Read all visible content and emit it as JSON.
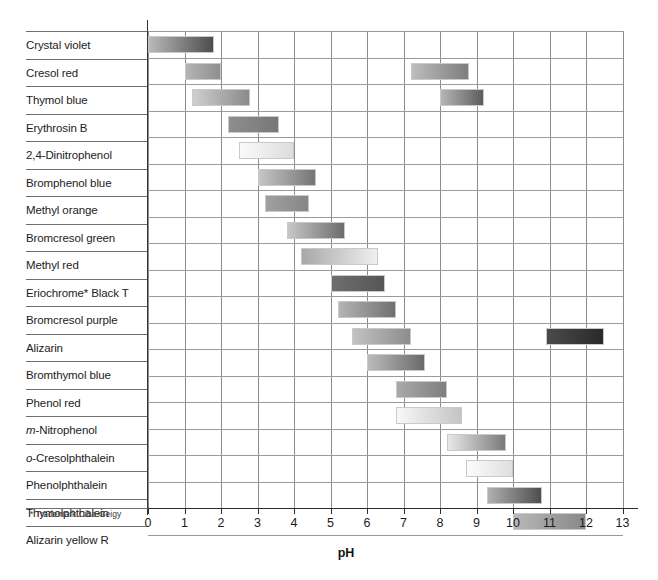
{
  "figure": {
    "axis_title": "pH",
    "footnote": "* Trademark Ciba-Geigy",
    "tick_labels": [
      "0",
      "1",
      "2",
      "3",
      "4",
      "5",
      "6",
      "7",
      "8",
      "9",
      "10",
      "11",
      "12",
      "13"
    ]
  },
  "chart_data": {
    "type": "bar",
    "orientation": "horizontal-range",
    "title": "",
    "xlabel": "pH",
    "ylabel": "",
    "xlim": [
      0,
      13
    ],
    "xticks": [
      0,
      1,
      2,
      3,
      4,
      5,
      6,
      7,
      8,
      9,
      10,
      11,
      12,
      13
    ],
    "grid": "vertical-and-horizontal",
    "legend": "none",
    "note": "Each indicator shows its pH transition interval(s) as a shaded colour-change band (rendered in greyscale).",
    "categories": [
      "Crystal violet",
      "Cresol red",
      "Thymol blue",
      "Erythrosin B",
      "2,4-Dinitrophenol",
      "Bromphenol blue",
      "Methyl orange",
      "Bromcresol green",
      "Methyl red",
      "Eriochrome* Black T",
      "Bromcresol purple",
      "Alizarin",
      "Bromthymol blue",
      "Phenol red",
      "m-Nitrophenol",
      "o-Cresolphthalein",
      "Phenolphthalein",
      "Thymolphthalein",
      "Alizarin yellow R"
    ],
    "indicators": [
      {
        "name": "Crystal violet",
        "label_html": "Crystal violet",
        "ranges": [
          {
            "start": 0.0,
            "end": 1.8
          }
        ],
        "shades": [
          [
            "#b9b9b9",
            "#4d4d4d"
          ]
        ]
      },
      {
        "name": "Cresol red",
        "label_html": "Cresol red",
        "ranges": [
          {
            "start": 1.0,
            "end": 2.0
          },
          {
            "start": 7.2,
            "end": 8.8
          }
        ],
        "shades": [
          [
            "#b4b4b4",
            "#8f8f8f"
          ],
          [
            "#bdbdbd",
            "#7d7d7d"
          ]
        ]
      },
      {
        "name": "Thymol blue",
        "label_html": "Thymol blue",
        "ranges": [
          {
            "start": 1.2,
            "end": 2.8
          },
          {
            "start": 8.0,
            "end": 9.2
          }
        ],
        "shades": [
          [
            "#cfcfcf",
            "#8a8a8a"
          ],
          [
            "#b5b5b5",
            "#5d5d5d"
          ]
        ]
      },
      {
        "name": "Erythrosin B",
        "label_html": "Erythrosin B",
        "ranges": [
          {
            "start": 2.2,
            "end": 3.6
          }
        ],
        "shades": [
          [
            "#8e8e8e",
            "#777777"
          ]
        ]
      },
      {
        "name": "2,4-Dinitrophenol",
        "label_html": "2,4-Dinitrophenol",
        "ranges": [
          {
            "start": 2.5,
            "end": 4.0
          }
        ],
        "shades": [
          [
            "#fafafa",
            "#dcdcdc"
          ]
        ]
      },
      {
        "name": "Bromphenol blue",
        "label_html": "Bromphenol blue",
        "ranges": [
          {
            "start": 3.0,
            "end": 4.6
          }
        ],
        "shades": [
          [
            "#c6c6c6",
            "#757575"
          ]
        ]
      },
      {
        "name": "Methyl orange",
        "label_html": "Methyl orange",
        "ranges": [
          {
            "start": 3.2,
            "end": 4.4
          }
        ],
        "shades": [
          [
            "#a0a0a0",
            "#868686"
          ]
        ]
      },
      {
        "name": "Bromcresol green",
        "label_html": "Bromcresol green",
        "ranges": [
          {
            "start": 3.8,
            "end": 5.4
          }
        ],
        "shades": [
          [
            "#c7c7c7",
            "#6c6c6c"
          ]
        ]
      },
      {
        "name": "Methyl red",
        "label_html": "Methyl red",
        "ranges": [
          {
            "start": 4.2,
            "end": 6.3
          }
        ],
        "shades": [
          [
            "#a8a8a8",
            "#efefef"
          ]
        ]
      },
      {
        "name": "Eriochrome* Black T",
        "label_html": "Eriochrome* Black T",
        "ranges": [
          {
            "start": 5.0,
            "end": 6.5
          }
        ],
        "shades": [
          [
            "#6e6e6e",
            "#565656"
          ]
        ]
      },
      {
        "name": "Bromcresol purple",
        "label_html": "Bromcresol purple",
        "ranges": [
          {
            "start": 5.2,
            "end": 6.8
          }
        ],
        "shades": [
          [
            "#b4b4b4",
            "#707070"
          ]
        ]
      },
      {
        "name": "Alizarin",
        "label_html": "Alizarin",
        "ranges": [
          {
            "start": 5.6,
            "end": 7.2
          },
          {
            "start": 10.9,
            "end": 12.5
          }
        ],
        "shades": [
          [
            "#c2c2c2",
            "#8d8d8d"
          ],
          [
            "#4a4a4a",
            "#2a2a2a"
          ]
        ]
      },
      {
        "name": "Bromthymol blue",
        "label_html": "Bromthymol blue",
        "ranges": [
          {
            "start": 6.0,
            "end": 7.6
          }
        ],
        "shades": [
          [
            "#bbbbbb",
            "#6a6a6a"
          ]
        ]
      },
      {
        "name": "Phenol red",
        "label_html": "Phenol red",
        "ranges": [
          {
            "start": 6.8,
            "end": 8.2
          }
        ],
        "shades": [
          [
            "#a9a9a9",
            "#7e7e7e"
          ]
        ]
      },
      {
        "name": "m-Nitrophenol",
        "label_html": "<i>m</i>-Nitrophenol",
        "ranges": [
          {
            "start": 6.8,
            "end": 8.6
          }
        ],
        "shades": [
          [
            "#f8f8f8",
            "#c4c4c4"
          ]
        ]
      },
      {
        "name": "o-Cresolphthalein",
        "label_html": "<i>o</i>-Cresolphthalein",
        "ranges": [
          {
            "start": 8.2,
            "end": 9.8
          }
        ],
        "shades": [
          [
            "#e8e8e8",
            "#7a7a7a"
          ]
        ]
      },
      {
        "name": "Phenolphthalein",
        "label_html": "Phenolphthalein",
        "ranges": [
          {
            "start": 8.7,
            "end": 10.0
          }
        ],
        "shades": [
          [
            "#fcfcfc",
            "#dfdfdf"
          ]
        ]
      },
      {
        "name": "Thymolphthalein",
        "label_html": "Thymolphthalein",
        "ranges": [
          {
            "start": 9.3,
            "end": 10.8
          }
        ],
        "shades": [
          [
            "#b0b0b0",
            "#4e4e4e"
          ]
        ]
      },
      {
        "name": "Alizarin yellow R",
        "label_html": "Alizarin yellow R",
        "ranges": [
          {
            "start": 10.0,
            "end": 12.0
          }
        ],
        "shades": [
          [
            "#b8b8b8",
            "#888888"
          ]
        ]
      }
    ]
  }
}
